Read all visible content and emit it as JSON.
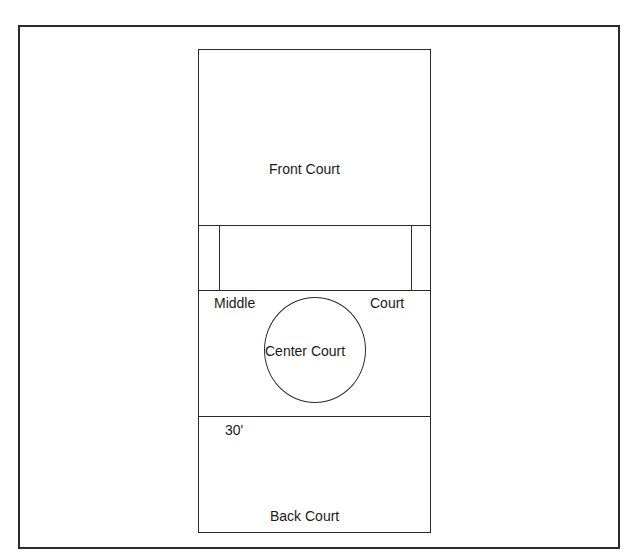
{
  "diagram": {
    "type": "court-layout",
    "labels": {
      "front_court": "Front Court",
      "middle": "Middle",
      "court": "Court",
      "center_court": "Center Court",
      "dimension": "30'",
      "back_court": "Back Court"
    },
    "colors": {
      "line": "#2a2a2a",
      "background": "#ffffff"
    }
  }
}
